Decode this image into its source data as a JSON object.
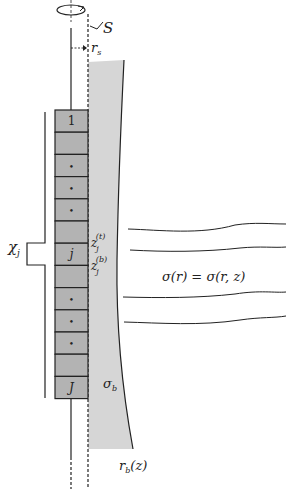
{
  "diagram": {
    "labels": {
      "surface": "S",
      "radius_s": "r",
      "radius_s_sub": "s",
      "chi": "χ",
      "chi_sub": "j",
      "z_top": "z",
      "z_top_sub": "j",
      "z_top_sup": "(t)",
      "z_bot": "z",
      "z_bot_sub": "j",
      "z_bot_sup": "(b)",
      "sigma_eq": "σ(r) = σ(r, z)",
      "sigma_b": "σ",
      "sigma_b_sub": "b",
      "rb": "r",
      "rb_sub": "b",
      "rb_arg": "(z)"
    },
    "blocks": [
      "1",
      "",
      "•",
      "•",
      "•",
      "",
      "j",
      "",
      "•",
      "•",
      "•",
      "",
      "J"
    ],
    "colors": {
      "block_fill": "#b3b3b3",
      "borehole_fill": "#d6d6d6",
      "line": "#222222"
    }
  }
}
